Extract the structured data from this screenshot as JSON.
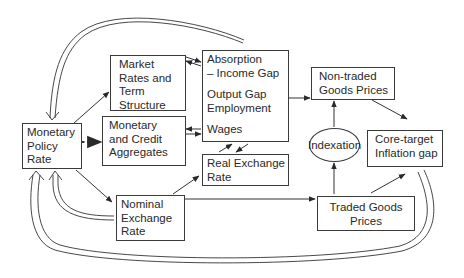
{
  "diagram": {
    "nodes": {
      "policy_rate": {
        "lines": [
          "Monetary",
          "Policy",
          "Rate"
        ]
      },
      "market_rates": {
        "lines": [
          "Market",
          "Rates and",
          "Term",
          "Structure"
        ]
      },
      "aggregates": {
        "lines": [
          "Monetary",
          "and Credit",
          "Aggregates"
        ]
      },
      "absorption": {
        "lines": [
          "Absorption",
          "– Income Gap",
          "Output Gap",
          "Employment",
          "Wages"
        ]
      },
      "real_fx": {
        "lines": [
          "Real Exchange",
          "Rate"
        ]
      },
      "nominal_fx": {
        "lines": [
          "Nominal",
          "Exchange",
          "Rate"
        ]
      },
      "nontraded": {
        "lines": [
          "Non-traded",
          "Goods Prices"
        ]
      },
      "indexation": {
        "label": "Indexation"
      },
      "core_gap": {
        "lines": [
          "Core-target",
          "Inflation gap"
        ]
      },
      "traded": {
        "lines": [
          "Traded Goods",
          "Prices"
        ]
      }
    },
    "edges": [
      {
        "from": "policy_rate",
        "to": "market_rates",
        "style": "solid"
      },
      {
        "from": "policy_rate",
        "to": "aggregates",
        "style": "dotted"
      },
      {
        "from": "policy_rate",
        "to": "nominal_fx",
        "style": "solid"
      },
      {
        "from": "market_rates",
        "to": "absorption",
        "style": "bidirectional"
      },
      {
        "from": "aggregates",
        "to": "absorption",
        "style": "bidirectional"
      },
      {
        "from": "real_fx",
        "to": "absorption",
        "style": "bidirectional"
      },
      {
        "from": "nominal_fx",
        "to": "real_fx",
        "style": "solid"
      },
      {
        "from": "nominal_fx",
        "to": "traded",
        "style": "solid"
      },
      {
        "from": "absorption",
        "to": "nontraded",
        "style": "solid"
      },
      {
        "from": "indexation",
        "to": "nontraded",
        "style": "solid"
      },
      {
        "from": "traded",
        "to": "indexation",
        "style": "solid"
      },
      {
        "from": "traded",
        "to": "core_gap",
        "style": "solid"
      },
      {
        "from": "nontraded",
        "to": "core_gap",
        "style": "solid"
      },
      {
        "from": "absorption",
        "to": "policy_rate",
        "style": "feedback"
      },
      {
        "from": "nominal_fx",
        "to": "policy_rate",
        "style": "feedback"
      },
      {
        "from": "core_gap",
        "to": "policy_rate",
        "style": "feedback"
      }
    ]
  }
}
